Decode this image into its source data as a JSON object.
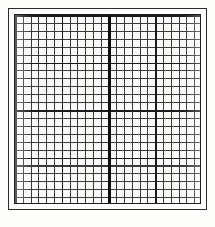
{
  "document": {
    "kind": "graph-paper",
    "title": "Blank square grid graph paper",
    "caption": ""
  },
  "chart_data": {
    "type": "table",
    "title": "",
    "subtitle": "",
    "xlabel": "",
    "ylabel": "",
    "grid": true,
    "legend": "none",
    "categories": [],
    "values": [],
    "series": [],
    "annotations": [],
    "grid_spec": {
      "columns": 24,
      "rows": 24,
      "cell_width_px": 7.79,
      "cell_height_px": 7.92,
      "major_every": 6,
      "major_vertical_indices": [
        0,
        6,
        12,
        18,
        24
      ],
      "major_horizontal_indices": [
        0,
        6,
        12,
        18,
        24
      ],
      "emphasized_axis": "vertical-center",
      "emphasized_axis_index": 12,
      "xlim": [
        0,
        24
      ],
      "ylim": [
        0,
        24
      ]
    }
  },
  "style": {
    "page_background": "#ffffff",
    "plate_background": "#fafaf8",
    "frame_color": "#2b2b2b",
    "grid_minor_color": "#3a3a3a",
    "grid_major_color": "#1a1a1a",
    "axis_color": "#0d0d0d"
  },
  "labels": {
    "x_ticks": [],
    "y_ticks": [],
    "corner_marks": []
  }
}
